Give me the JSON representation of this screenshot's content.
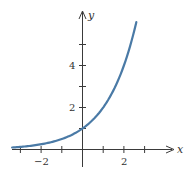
{
  "chart_data": {
    "type": "line",
    "title": "",
    "function": "y = 2^x",
    "xlabel": "x",
    "ylabel": "y",
    "xlim": [
      -3.4,
      4.5
    ],
    "ylim": [
      -0.9,
      6.6
    ],
    "grid": false,
    "legend": null,
    "x_ticks": [
      -3,
      -2,
      -1,
      0,
      1,
      2,
      3
    ],
    "x_tick_labels": [
      {
        "value": -2,
        "label": "−2"
      },
      {
        "value": 2,
        "label": "2"
      }
    ],
    "y_ticks": [
      1,
      2,
      3,
      4,
      5
    ],
    "y_tick_labels": [
      {
        "value": 2,
        "label": "2"
      },
      {
        "value": 4,
        "label": "4"
      }
    ],
    "series": [
      {
        "name": "y = 2^x",
        "color": "#4a7aa6",
        "x": [
          -3.4,
          -3,
          -2.5,
          -2,
          -1.5,
          -1,
          -0.5,
          0,
          0.5,
          1,
          1.5,
          2,
          2.3,
          2.6
        ],
        "y": [
          0.095,
          0.125,
          0.177,
          0.25,
          0.354,
          0.5,
          0.707,
          1,
          1.414,
          2,
          2.828,
          4,
          4.925,
          6.063
        ]
      }
    ],
    "annotations": []
  },
  "labels": {
    "x_axis": "x",
    "y_axis": "y",
    "xtick_neg2": "−2",
    "xtick_2": "2",
    "ytick_2": "2",
    "ytick_4": "4"
  },
  "colors": {
    "curve": "#4a7aa6",
    "axis": "#3a3a3a"
  }
}
